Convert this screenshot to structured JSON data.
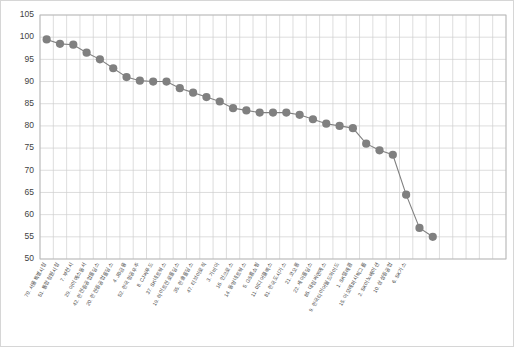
{
  "chart_data": {
    "type": "line",
    "title": "",
    "subtitle": "",
    "xlabel": "",
    "ylabel": "",
    "ylim": [
      50,
      105
    ],
    "ytick_step": 5,
    "yticks": [
      50,
      55,
      60,
      65,
      70,
      75,
      80,
      85,
      90,
      95,
      100,
      105
    ],
    "grid": true,
    "legend": "none",
    "marker": "circle",
    "marker_color": "#808080",
    "line_color": "#808080",
    "categories": [
      "70. 서울특별시청",
      "51. 통합창원시청",
      "7. 부천시",
      "29. 아이에스동서",
      "42. 한진중공업홀딩스",
      "20. 한진중공업홀딩스",
      "4. JB금융",
      "52. 한국항공우주",
      "8. CJ씨푸드",
      "37. SK네트웍스",
      "19. 하이트진로홀딩스",
      "35. 한솔홀딩스",
      "47. 티브이로직",
      "3. 가비아",
      "16. 인크로스",
      "14. 동양네트웍스",
      "5. GS홈쇼핑",
      "11. 미디어플렉스",
      "81. 한국도시가스",
      "21. 코오롱",
      "22. 세아홀딩스",
      "85. 대림씨엔에스",
      "9. 한국타이어월드와이드",
      "1. SK텔레콤",
      "15. 아모레퍼시픽그룹",
      "2. SK이노베이션",
      "10. 삼성중공업",
      "6. SK가스"
    ],
    "values": [
      99.5,
      98.5,
      98.3,
      96.5,
      95.0,
      93.0,
      91.0,
      90.2,
      90.0,
      90.0,
      88.5,
      87.5,
      86.5,
      85.5,
      84.0,
      83.5,
      83.0,
      83.0,
      83.0,
      82.5,
      81.5,
      80.5,
      80.0,
      79.5,
      76.0,
      74.5,
      73.5,
      64.5
    ]
  },
  "extra_points": {
    "tail_values": [
      57.0,
      55.0
    ],
    "tail_labels": [
      "",
      ""
    ]
  }
}
